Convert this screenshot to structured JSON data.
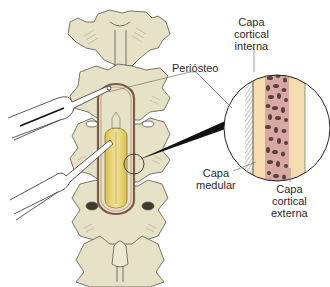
{
  "figure": {
    "colors": {
      "bone": "#e6e1c7",
      "bone_shadow": "#b9b39a",
      "bone_outline": "#5b5647",
      "spinal_cord": "#e9d36a",
      "spinal_cord_light": "#f3e29a",
      "dura": "#c9a98f",
      "cortical": "#f6dcae",
      "medullary_bg": "#d8a9a4",
      "medullary_spots": "#5a4040",
      "periosteum_hatch": "#6f6f6f",
      "instrument": "#ffffff",
      "instrument_outline": "#4a4a4a",
      "pointer": "#111111",
      "leader_line": "#777777",
      "label_text": "#2a2a2a"
    }
  },
  "labels": {
    "periosteo": {
      "lines": [
        "Periósteo"
      ]
    },
    "capa_cortical_interna": {
      "lines": [
        "Capa",
        "cortical",
        "interna"
      ]
    },
    "capa_medular": {
      "lines": [
        "Capa",
        "medular"
      ]
    },
    "capa_cortical_externa": {
      "lines": [
        "Capa",
        "cortical",
        "externa"
      ]
    }
  }
}
